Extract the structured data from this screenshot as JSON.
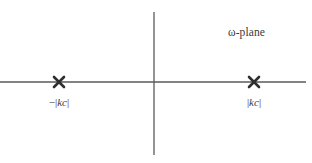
{
  "figure": {
    "name": "omega-plane-diagram",
    "background_color": "#ffffff",
    "line_color": "#5a5a5a",
    "marker_color": "#2e2e2e",
    "text_color": "#3b3b3b",
    "width": 312,
    "height": 163
  },
  "plane_label": {
    "text": "ω-plane",
    "x": 228,
    "y": 27
  },
  "axes": {
    "horizontal": {
      "name": "real-axis",
      "x1": 0,
      "y1": 82,
      "x2": 306,
      "y2": 82,
      "stroke_width": 1.6
    },
    "vertical": {
      "name": "imaginary-axis",
      "x1": 154,
      "y1": 12,
      "x2": 154,
      "y2": 155,
      "stroke_width": 1.3
    }
  },
  "markers": [
    {
      "name": "pole-marker-negative",
      "glyph": "x-cross",
      "x": 59,
      "y": 82,
      "size": 5.0,
      "label": {
        "sign": "−",
        "bar_open": "|",
        "symbol": "kc",
        "bar_close": "|",
        "full_text": "−|kc|",
        "x": 59,
        "y": 97
      }
    },
    {
      "name": "pole-marker-positive",
      "glyph": "x-cross",
      "x": 254,
      "y": 82,
      "size": 5.0,
      "label": {
        "sign": "",
        "bar_open": "|",
        "symbol": "kc",
        "bar_close": "|",
        "full_text": "|kc|",
        "x": 254,
        "y": 97
      }
    }
  ],
  "chart_data": {
    "type": "scatter",
    "title": "ω-plane",
    "xlabel": "",
    "ylabel": "",
    "grid": false,
    "legend": null,
    "axis_lines": [
      "real-axis",
      "imaginary-axis"
    ],
    "points": [
      {
        "label": "−|kc|",
        "x": -1,
        "y": 0,
        "marker": "x"
      },
      {
        "label": "|kc|",
        "x": 1,
        "y": 0,
        "marker": "x"
      }
    ],
    "annotations": [
      "ω-plane",
      "−|kc|",
      "|kc|"
    ]
  }
}
